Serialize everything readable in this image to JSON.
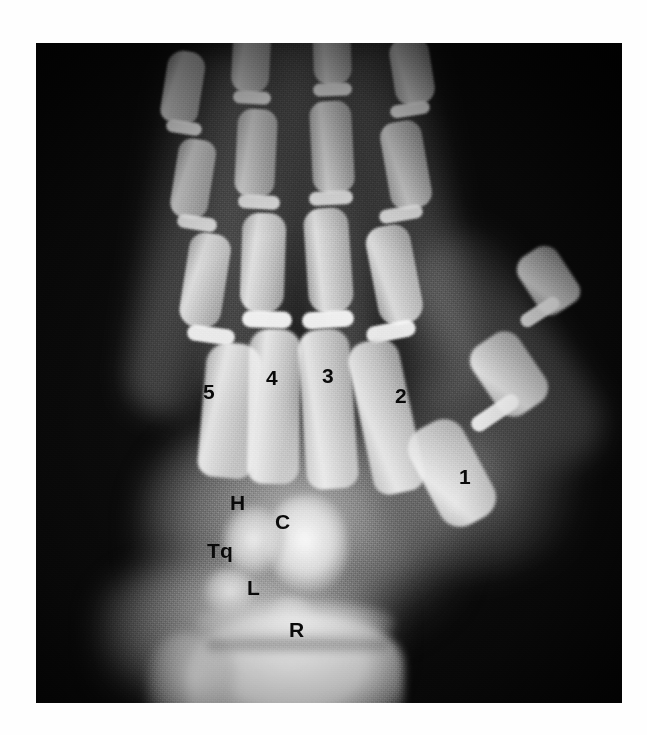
{
  "figure": {
    "kind": "radiograph",
    "modality": "x-ray",
    "body_part": "left hand and wrist",
    "view": "posteroanterior",
    "plate": {
      "x": 36,
      "y": 43,
      "width": 586,
      "height": 660
    },
    "background_color": "#ffffff",
    "film_color": "#0b0b0b",
    "label_color": "#0a0a0a"
  },
  "labels": [
    {
      "id": "mc5",
      "text": "5",
      "x": 203,
      "y": 392,
      "size": 21,
      "name": "label-metacarpal-5"
    },
    {
      "id": "mc4",
      "text": "4",
      "x": 266,
      "y": 378,
      "size": 21,
      "name": "label-metacarpal-4"
    },
    {
      "id": "mc3",
      "text": "3",
      "x": 322,
      "y": 376,
      "size": 21,
      "name": "label-metacarpal-3"
    },
    {
      "id": "mc2",
      "text": "2",
      "x": 395,
      "y": 396,
      "size": 21,
      "name": "label-metacarpal-2"
    },
    {
      "id": "mc1",
      "text": "1",
      "x": 459,
      "y": 477,
      "size": 21,
      "name": "label-metacarpal-1"
    },
    {
      "id": "hamate",
      "text": "H",
      "x": 236,
      "y": 503,
      "size": 21,
      "name": "label-hamate"
    },
    {
      "id": "capitate",
      "text": "C",
      "x": 281,
      "y": 522,
      "size": 21,
      "name": "label-capitate"
    },
    {
      "id": "triquetrum",
      "text": "Tq",
      "x": 217,
      "y": 551,
      "size": 21,
      "name": "label-triquetrum"
    },
    {
      "id": "lunate",
      "text": "L",
      "x": 252,
      "y": 588,
      "size": 21,
      "name": "label-lunate"
    },
    {
      "id": "radius",
      "text": "R",
      "x": 296,
      "y": 630,
      "size": 21,
      "name": "label-radius"
    }
  ],
  "legend": {
    "5": "fifth metacarpal",
    "4": "fourth metacarpal",
    "3": "third metacarpal",
    "2": "second metacarpal",
    "1": "first metacarpal",
    "H": "hamate",
    "C": "capitate",
    "Tq": "triquetrum",
    "L": "lunate",
    "R": "radius"
  }
}
